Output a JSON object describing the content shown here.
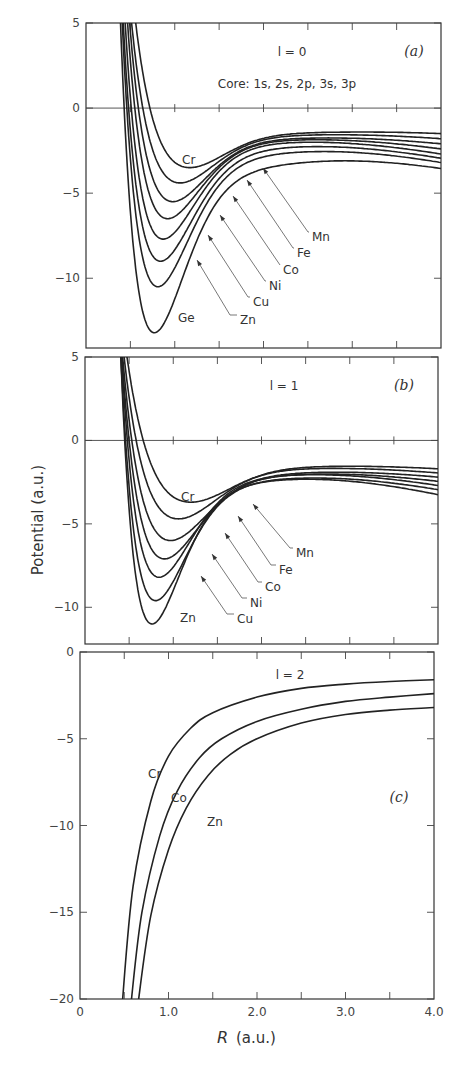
{
  "chart_data": [
    {
      "type": "line",
      "panel": "a",
      "panel_tag": "(a)",
      "annotation": "l = 0",
      "subtitle": "Core: 1s, 2s, 2p, 3s, 3p",
      "xlabel": "R (a.u.)",
      "ylabel": "Potential (a.u.)",
      "xlim": [
        0,
        4.0
      ],
      "ylim": [
        -14.1,
        5
      ],
      "yticks": [
        5,
        0,
        -5,
        -10
      ],
      "ytick_labels": [
        "5",
        "0",
        "−5",
        "−10"
      ],
      "xticks": [
        0.5,
        1.0,
        1.5,
        2.0,
        2.5,
        3.0,
        3.5
      ],
      "zero_line": true,
      "series": [
        {
          "name": "Cr",
          "r_zero": 0.72,
          "r_min": 1.17,
          "v_min": -3.5,
          "v_at_4": -1.5
        },
        {
          "name": "Mn",
          "r_zero": 0.64,
          "r_min": 1.06,
          "v_min": -4.4,
          "v_at_4": -1.8
        },
        {
          "name": "Fe",
          "r_zero": 0.59,
          "r_min": 0.98,
          "v_min": -5.5,
          "v_at_4": -2.1
        },
        {
          "name": "Co",
          "r_zero": 0.55,
          "r_min": 0.92,
          "v_min": -6.5,
          "v_at_4": -2.4
        },
        {
          "name": "Ni",
          "r_zero": 0.51,
          "r_min": 0.87,
          "v_min": -7.7,
          "v_at_4": -2.7
        },
        {
          "name": "Cu",
          "r_zero": 0.48,
          "r_min": 0.84,
          "v_min": -9.0,
          "v_at_4": -2.95
        },
        {
          "name": "Zn",
          "r_zero": 0.46,
          "r_min": 0.81,
          "v_min": -10.5,
          "v_at_4": -3.2
        },
        {
          "name": "Ge",
          "r_zero": 0.43,
          "r_min": 0.77,
          "v_min": -13.2,
          "v_at_4": -3.55
        }
      ],
      "labels": [
        {
          "text": "Cr",
          "series": "Cr",
          "type": "inline"
        },
        {
          "text": "Mn",
          "series": "Mn",
          "type": "leader"
        },
        {
          "text": "Fe",
          "series": "Fe",
          "type": "leader"
        },
        {
          "text": "Co",
          "series": "Co",
          "type": "leader"
        },
        {
          "text": "Ni",
          "series": "Ni",
          "type": "leader"
        },
        {
          "text": "Cu",
          "series": "Cu",
          "type": "leader"
        },
        {
          "text": "Zn",
          "series": "Zn",
          "type": "leader"
        },
        {
          "text": "Ge",
          "series": "Ge",
          "type": "inline"
        }
      ]
    },
    {
      "type": "line",
      "panel": "b",
      "panel_tag": "(b)",
      "annotation": "l = 1",
      "xlabel": "R (a.u.)",
      "ylabel": "Potential (a.u.)",
      "xlim": [
        0,
        4.0
      ],
      "ylim": [
        -12.2,
        5
      ],
      "yticks": [
        5,
        0,
        -5,
        -10
      ],
      "ytick_labels": [
        "5",
        "0",
        "−5",
        "−10"
      ],
      "xticks": [
        0.5,
        1.0,
        1.5,
        2.0,
        2.5,
        3.0,
        3.5
      ],
      "zero_line": true,
      "series": [
        {
          "name": "Cr",
          "r_zero": 0.66,
          "r_min": 1.2,
          "v_min": -3.7,
          "v_at_4": -1.7
        },
        {
          "name": "Mn",
          "r_zero": 0.58,
          "r_min": 1.06,
          "v_min": -4.7,
          "v_at_4": -1.95
        },
        {
          "name": "Fe",
          "r_zero": 0.53,
          "r_min": 0.97,
          "v_min": -6.0,
          "v_at_4": -2.2
        },
        {
          "name": "Co",
          "r_zero": 0.5,
          "r_min": 0.9,
          "v_min": -7.1,
          "v_at_4": -2.45
        },
        {
          "name": "Ni",
          "r_zero": 0.48,
          "r_min": 0.84,
          "v_min": -8.2,
          "v_at_4": -2.7
        },
        {
          "name": "Cu",
          "r_zero": 0.46,
          "r_min": 0.8,
          "v_min": -9.6,
          "v_at_4": -2.95
        },
        {
          "name": "Zn",
          "r_zero": 0.45,
          "r_min": 0.76,
          "v_min": -11.0,
          "v_at_4": -3.25
        }
      ],
      "labels": [
        {
          "text": "Cr",
          "series": "Cr",
          "type": "inline"
        },
        {
          "text": "Mn",
          "series": "Mn",
          "type": "leader"
        },
        {
          "text": "Fe",
          "series": "Fe",
          "type": "leader"
        },
        {
          "text": "Co",
          "series": "Co",
          "type": "leader"
        },
        {
          "text": "Ni",
          "series": "Ni",
          "type": "leader"
        },
        {
          "text": "Cu",
          "series": "Cu",
          "type": "leader"
        },
        {
          "text": "Zn",
          "series": "Zn",
          "type": "inline"
        }
      ]
    },
    {
      "type": "line",
      "panel": "c",
      "panel_tag": "(c)",
      "annotation": "l = 2",
      "xlabel": "R (a.u.)",
      "ylabel": "Potential (a.u.)",
      "xlim": [
        0,
        4.0
      ],
      "ylim": [
        -20,
        0
      ],
      "yticks": [
        0,
        -5,
        -10,
        -15,
        -20
      ],
      "ytick_labels": [
        "0",
        "−5",
        "−10",
        "−15",
        "−20"
      ],
      "xticks": [
        0,
        0.5,
        1.0,
        1.5,
        2.0,
        2.5,
        3.0,
        3.5,
        4.0
      ],
      "xtick_labels": [
        "0",
        "1.0",
        "2.0",
        "3.0",
        "4.0"
      ],
      "xtick_label_values": [
        0,
        1.0,
        2.0,
        3.0,
        4.0
      ],
      "zero_line": false,
      "series": [
        {
          "name": "Cr",
          "r_at_ymin": 0.48,
          "v_at_4": -1.6,
          "points": [
            [
              0.48,
              -20
            ],
            [
              0.6,
              -13.5
            ],
            [
              0.8,
              -8.6
            ],
            [
              1.0,
              -6.0
            ],
            [
              1.25,
              -4.4
            ],
            [
              1.5,
              -3.5
            ],
            [
              2.0,
              -2.6
            ],
            [
              2.5,
              -2.1
            ],
            [
              3.0,
              -1.85
            ],
            [
              3.5,
              -1.7
            ],
            [
              4.0,
              -1.6
            ]
          ]
        },
        {
          "name": "Co",
          "r_at_ymin": 0.58,
          "v_at_4": -2.4,
          "points": [
            [
              0.58,
              -20
            ],
            [
              0.7,
              -15.0
            ],
            [
              0.9,
              -10.6
            ],
            [
              1.1,
              -8.0
            ],
            [
              1.35,
              -6.1
            ],
            [
              1.6,
              -5.0
            ],
            [
              2.0,
              -4.0
            ],
            [
              2.5,
              -3.3
            ],
            [
              3.0,
              -2.85
            ],
            [
              3.5,
              -2.6
            ],
            [
              4.0,
              -2.4
            ]
          ]
        },
        {
          "name": "Zn",
          "r_at_ymin": 0.66,
          "v_at_4": -3.2,
          "points": [
            [
              0.66,
              -20
            ],
            [
              0.8,
              -15.2
            ],
            [
              1.0,
              -11.4
            ],
            [
              1.2,
              -9.0
            ],
            [
              1.45,
              -7.1
            ],
            [
              1.7,
              -5.9
            ],
            [
              2.0,
              -5.0
            ],
            [
              2.5,
              -4.1
            ],
            [
              3.0,
              -3.6
            ],
            [
              3.5,
              -3.35
            ],
            [
              4.0,
              -3.2
            ]
          ]
        }
      ],
      "labels": [
        {
          "text": "Cr",
          "series": "Cr",
          "type": "inline"
        },
        {
          "text": "Co",
          "series": "Co",
          "type": "inline"
        },
        {
          "text": "Zn",
          "series": "Zn",
          "type": "inline"
        }
      ]
    }
  ],
  "figure": {
    "shared_ylabel": "Potential (a.u.)",
    "shared_xlabel_symbol": "R",
    "shared_xlabel_units": "(a.u.)"
  }
}
